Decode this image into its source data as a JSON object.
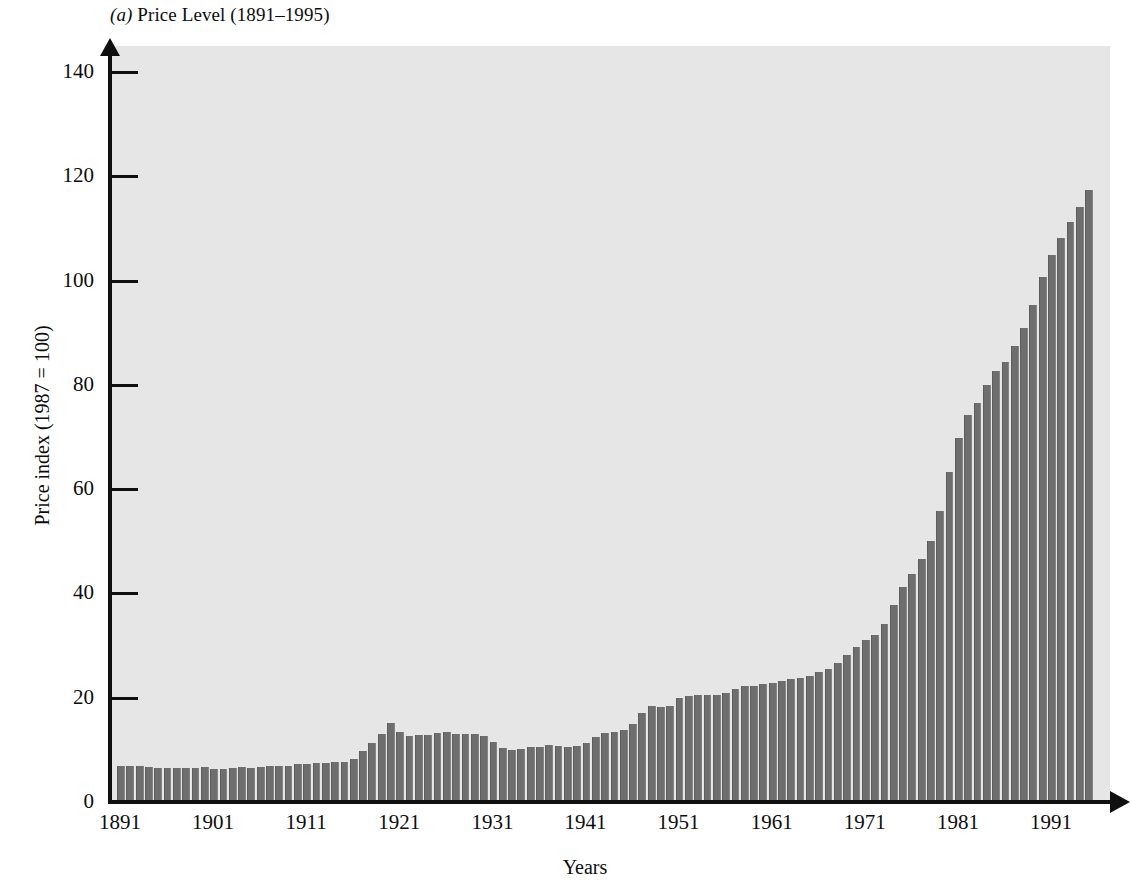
{
  "figure": {
    "panel_label": "(a)",
    "title_text": "Price Level (1891–1995)",
    "title_full": "(a) Price Level (1891–1995)"
  },
  "axes": {
    "y_axis_title": "Price index (1987 = 100)",
    "x_axis_title": "Years",
    "y_ticks": [
      "0",
      "20",
      "40",
      "60",
      "80",
      "100",
      "120",
      "140"
    ],
    "x_ticks": [
      "1891",
      "1901",
      "1911",
      "1921",
      "1931",
      "1941",
      "1951",
      "1961",
      "1971",
      "1981",
      "1991"
    ]
  },
  "colors": {
    "bar_fill": "#6e6e6e",
    "plot_background": "#e6e6e6",
    "axis_line": "#101010",
    "page_background": "#ffffff",
    "text": "#0d0d0d"
  },
  "chart_data": {
    "type": "bar",
    "title": "(a) Price Level (1891–1995)",
    "xlabel": "Years",
    "ylabel": "Price index (1987 = 100)",
    "ylim": [
      0,
      145
    ],
    "xlim": [
      1891,
      1995
    ],
    "grid": false,
    "legend": "none",
    "ytick_values": [
      0,
      20,
      40,
      60,
      80,
      100,
      120,
      140
    ],
    "xtick_values": [
      1891,
      1901,
      1911,
      1921,
      1931,
      1941,
      1951,
      1961,
      1971,
      1981,
      1991
    ],
    "series_name": "Consumer price index (1987 = 100)",
    "categories": [
      1891,
      1892,
      1893,
      1894,
      1895,
      1896,
      1897,
      1898,
      1899,
      1900,
      1901,
      1902,
      1903,
      1904,
      1905,
      1906,
      1907,
      1908,
      1909,
      1910,
      1911,
      1912,
      1913,
      1914,
      1915,
      1916,
      1917,
      1918,
      1919,
      1920,
      1921,
      1922,
      1923,
      1924,
      1925,
      1926,
      1927,
      1928,
      1929,
      1930,
      1931,
      1932,
      1933,
      1934,
      1935,
      1936,
      1937,
      1938,
      1939,
      1940,
      1941,
      1942,
      1943,
      1944,
      1945,
      1946,
      1947,
      1948,
      1949,
      1950,
      1951,
      1952,
      1953,
      1954,
      1955,
      1956,
      1957,
      1958,
      1959,
      1960,
      1961,
      1962,
      1963,
      1964,
      1965,
      1966,
      1967,
      1968,
      1969,
      1970,
      1971,
      1972,
      1973,
      1974,
      1975,
      1976,
      1977,
      1978,
      1979,
      1980,
      1981,
      1982,
      1983,
      1984,
      1985,
      1986,
      1987,
      1988,
      1989,
      1990,
      1991,
      1992,
      1993,
      1994,
      1995
    ],
    "values": [
      7.0,
      7.0,
      7.0,
      6.7,
      6.6,
      6.6,
      6.6,
      6.6,
      6.6,
      6.7,
      6.3,
      6.4,
      6.6,
      6.7,
      6.6,
      6.7,
      7.0,
      6.9,
      6.9,
      7.2,
      7.2,
      7.4,
      7.5,
      7.6,
      7.7,
      8.2,
      9.7,
      11.4,
      13.1,
      15.2,
      13.5,
      12.7,
      12.9,
      12.9,
      13.3,
      13.4,
      13.1,
      13.0,
      13.0,
      12.7,
      11.5,
      10.4,
      9.9,
      10.2,
      10.5,
      10.6,
      11.0,
      10.7,
      10.6,
      10.7,
      11.3,
      12.5,
      13.2,
      13.5,
      13.8,
      15.0,
      17.1,
      18.5,
      18.3,
      18.5,
      19.9,
      20.4,
      20.5,
      20.6,
      20.5,
      20.9,
      21.6,
      22.2,
      22.3,
      22.7,
      22.9,
      23.2,
      23.5,
      23.8,
      24.2,
      24.9,
      25.6,
      26.7,
      28.1,
      29.8,
      31.1,
      32.1,
      34.1,
      37.8,
      41.3,
      43.7,
      46.6,
      50.1,
      55.8,
      63.3,
      69.9,
      74.2,
      76.6,
      79.9,
      82.7,
      84.3,
      87.4,
      91.0,
      95.4,
      100.6,
      104.9,
      108.1,
      111.3,
      114.2,
      117.4
    ],
    "bar_count": 105,
    "notes": [
      "WWI inflation peak at 1920 (≈15.2)",
      "Great Depression trough at 1933 (≈9.9)",
      "Sustained rise after 1970, steepest in late 1970s–1981",
      "Final bar 1995 reaches ≈129 on the plotted scale"
    ]
  }
}
